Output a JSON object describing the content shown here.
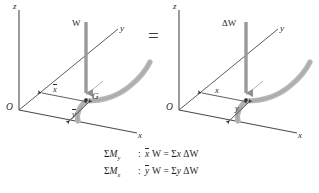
{
  "figure": {
    "equals_sign": "=",
    "colors": {
      "axis_line": "#4a4a4a",
      "body_fill": "#b8b8b8",
      "body_edge": "#8a8a8a",
      "force_arrow": "#9a9a9a",
      "dim_arrow": "#3a3a3a",
      "text": "#2b2b2b"
    },
    "left_diagram": {
      "name": "resultant-weight-diagram",
      "axis_z_label": "z",
      "axis_y_label": "y",
      "axis_x_label": "x",
      "origin_label": "O",
      "force_label": "W",
      "centroid_label": "G",
      "dim_x_label": "x",
      "dim_y_label": "y",
      "dim_x_has_bar": true,
      "dim_y_has_bar": true
    },
    "right_diagram": {
      "name": "differential-weight-diagram",
      "axis_z_label": "z",
      "axis_y_label": "y",
      "axis_x_label": "x",
      "origin_label": "O",
      "force_label": "ΔW",
      "dim_x_label": "x",
      "dim_y_label": "y",
      "dim_x_has_bar": false,
      "dim_y_has_bar": false
    },
    "equations": [
      {
        "moment_symbol": "M",
        "moment_axis": "y",
        "sigma": "Σ",
        "colon": ":",
        "lhs_var": "x",
        "lhs_var_bar": true,
        "lhs_weight": "W",
        "equals": "=",
        "rhs_sigma": "Σ",
        "rhs_var": "x",
        "rhs_weight": "ΔW"
      },
      {
        "moment_symbol": "M",
        "moment_axis": "x",
        "sigma": "Σ",
        "colon": ":",
        "lhs_var": "y",
        "lhs_var_bar": true,
        "lhs_weight": "W",
        "equals": "=",
        "rhs_sigma": "Σ",
        "rhs_var": "y",
        "rhs_weight": "ΔW"
      }
    ]
  }
}
